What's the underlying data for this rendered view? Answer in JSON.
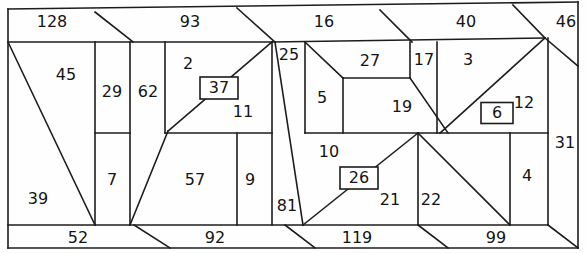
{
  "figure": {
    "title": "",
    "type": "rectangle-dissection-diagram",
    "stroke_color": "#1c1c1c",
    "background_color": "#ffffff",
    "label_color": "#141414"
  },
  "chart_data": {
    "type": "table",
    "title": "",
    "xlabel": "",
    "ylabel": "",
    "categories": [
      "128",
      "93",
      "16",
      "40",
      "46",
      "45",
      "29",
      "62",
      "2",
      "37",
      "11",
      "25",
      "27",
      "17",
      "3",
      "6",
      "12",
      "5",
      "19",
      "31",
      "39",
      "7",
      "57",
      "9",
      "81",
      "10",
      "26",
      "21",
      "22",
      "4",
      "52",
      "92",
      "119",
      "99"
    ],
    "values": [
      128,
      93,
      16,
      40,
      46,
      45,
      29,
      62,
      2,
      37,
      11,
      25,
      27,
      17,
      3,
      6,
      12,
      5,
      19,
      31,
      39,
      7,
      57,
      9,
      81,
      10,
      26,
      21,
      22,
      4,
      52,
      92,
      119,
      99
    ],
    "grid": false,
    "legend": "none"
  },
  "labels": {
    "top_band": [
      {
        "id": "l128",
        "text": "128",
        "x": 52,
        "y": 22
      },
      {
        "id": "l93",
        "text": "93",
        "x": 190,
        "y": 22
      },
      {
        "id": "l16",
        "text": "16",
        "x": 324,
        "y": 22
      },
      {
        "id": "l40",
        "text": "40",
        "x": 466,
        "y": 22
      },
      {
        "id": "l46",
        "text": "46",
        "x": 566,
        "y": 22
      }
    ],
    "interior": [
      {
        "id": "l45",
        "text": "45",
        "x": 66,
        "y": 75
      },
      {
        "id": "l39",
        "text": "39",
        "x": 38,
        "y": 199
      },
      {
        "id": "l29",
        "text": "29",
        "x": 112,
        "y": 92
      },
      {
        "id": "l7",
        "text": "7",
        "x": 112,
        "y": 180
      },
      {
        "id": "l62",
        "text": "62",
        "x": 148,
        "y": 92
      },
      {
        "id": "l2",
        "text": "2",
        "x": 188,
        "y": 64
      },
      {
        "id": "l11",
        "text": "11",
        "x": 243,
        "y": 112
      },
      {
        "id": "l57",
        "text": "57",
        "x": 195,
        "y": 180
      },
      {
        "id": "l9",
        "text": "9",
        "x": 250,
        "y": 180
      },
      {
        "id": "l25",
        "text": "25",
        "x": 289,
        "y": 55
      },
      {
        "id": "l81",
        "text": "81",
        "x": 287,
        "y": 206
      },
      {
        "id": "l5",
        "text": "5",
        "x": 322,
        "y": 98
      },
      {
        "id": "l27",
        "text": "27",
        "x": 370,
        "y": 61
      },
      {
        "id": "l19",
        "text": "19",
        "x": 402,
        "y": 107
      },
      {
        "id": "l17",
        "text": "17",
        "x": 424,
        "y": 60
      },
      {
        "id": "l3",
        "text": "3",
        "x": 468,
        "y": 60
      },
      {
        "id": "l12",
        "text": "12",
        "x": 524,
        "y": 103
      },
      {
        "id": "l31",
        "text": "31",
        "x": 565,
        "y": 143
      },
      {
        "id": "l10",
        "text": "10",
        "x": 329,
        "y": 152
      },
      {
        "id": "l21",
        "text": "21",
        "x": 390,
        "y": 200
      },
      {
        "id": "l22",
        "text": "22",
        "x": 431,
        "y": 200
      },
      {
        "id": "l4",
        "text": "4",
        "x": 527,
        "y": 176
      }
    ],
    "boxed": [
      {
        "id": "l37",
        "text": "37",
        "x": 219,
        "y": 88,
        "bw": 38,
        "bh": 22
      },
      {
        "id": "l6",
        "text": "6",
        "x": 497,
        "y": 113,
        "bw": 32,
        "bh": 21
      },
      {
        "id": "l26",
        "text": "26",
        "x": 359,
        "y": 178,
        "bw": 38,
        "bh": 22
      }
    ],
    "bottom_band": [
      {
        "id": "l52",
        "text": "52",
        "x": 78,
        "y": 238
      },
      {
        "id": "l92",
        "text": "92",
        "x": 215,
        "y": 238
      },
      {
        "id": "l119",
        "text": "119",
        "x": 357,
        "y": 238
      },
      {
        "id": "l99",
        "text": "99",
        "x": 496,
        "y": 238
      }
    ]
  },
  "geometry": {
    "outer_top": "M8,9 L578,2",
    "outer_left": "M8,9 L8,225",
    "outer_right": "M578,2 L578,248",
    "outer_bottom": "M8,248 L578,248",
    "band_top_line": "M8,42 L545,38",
    "band_bottom_line": "M8,225 L548,225",
    "edges": [
      "M8,9 L578,2",
      "M8,9 L8,248",
      "M578,2 L578,248",
      "M8,248 L578,248",
      "M8,42 L272,42",
      "M272,42 L545,38",
      "M8,225 L303,225",
      "M303,225 L548,225",
      "M95,12 L133,42",
      "M237,8 L275,42",
      "M380,10 L412,42",
      "M513,5 L545,38",
      "M545,38 L578,66",
      "M8,42 L95,225",
      "M95,42 L95,225",
      "M130,42 L130,225",
      "M95,133 L130,133",
      "M165,42 L165,133",
      "M165,133 L272,133",
      "M168,131 L272,42",
      "M130,225 L168,131",
      "M237,133 L237,225",
      "M272,42 L272,225",
      "M275,42 L303,225",
      "M305,42 L305,133",
      "M305,42 L343,78",
      "M343,78 L410,78",
      "M343,78 L343,133",
      "M410,42 L410,78",
      "M410,78 L448,133",
      "M437,42 L437,133",
      "M305,133 L548,133",
      "M545,38 L440,133",
      "M548,38 L548,225",
      "M303,225 L418,133",
      "M418,133 L510,225",
      "M418,133 L418,225",
      "M510,133 L510,225",
      "M134,225 L170,248",
      "M285,225 L315,248",
      "M418,225 L448,248",
      "M548,225 L578,248"
    ]
  }
}
